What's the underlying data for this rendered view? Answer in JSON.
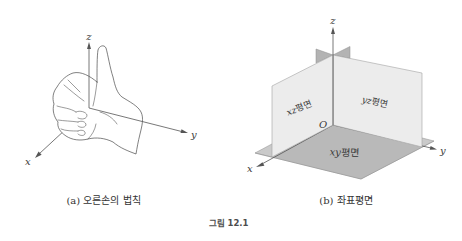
{
  "figure": {
    "number_label": "그림 12.1"
  },
  "panel_a": {
    "caption": "(a) 오른손의 법칙",
    "axis_labels": {
      "x": "x",
      "y": "y",
      "z": "z"
    }
  },
  "panel_b": {
    "caption": "(b) 좌표평면",
    "axis_labels": {
      "x": "x",
      "y": "y",
      "z": "z"
    },
    "origin_label": "O",
    "planes": {
      "xz": {
        "var": "xz",
        "word": "평면"
      },
      "yz": {
        "var": "yz",
        "word": "평면"
      },
      "xy": {
        "var": "xy",
        "word": "평면"
      }
    }
  },
  "colors": {
    "axis": "#555555",
    "hand_stroke": "#4a4a4a",
    "vertical_plane_fill": "#ececec",
    "vertical_plane_stroke": "#a3a3a3",
    "xy_plane_fill": "#b9b9b9",
    "xy_plane_outer_fill": "#cacaca",
    "xy_plane_stroke": "#8f8f8f",
    "fin_fill": "#b3b3b3",
    "caption_text": "#333333",
    "figure_label_text": "#4d4d4d"
  }
}
